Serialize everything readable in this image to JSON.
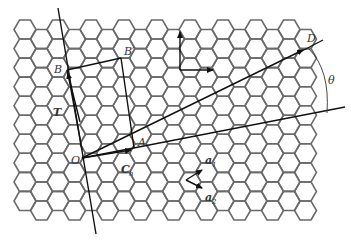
{
  "diagram": {
    "lattice": {
      "type": "honeycomb",
      "hex_orientation": "flat-top",
      "hex_side_px": 11,
      "origin_x": 25,
      "origin_y": 29.5,
      "cols": 18,
      "rows": 11,
      "stroke_color": "#6a6a6a"
    },
    "labels": {
      "O": "O",
      "A": "A",
      "B": "B",
      "B_prime": "B′",
      "D": "D",
      "T": "T",
      "C_h_main": "C",
      "C_h_sub": "h",
      "theta": "θ",
      "x_axis": "x",
      "y_axis": "y",
      "a1_main": "a",
      "a1_sub": "1",
      "a2_main": "a",
      "a2_sub": "2"
    },
    "points": {
      "O": [
        82,
        158
      ],
      "A": [
        134,
        149
      ],
      "B": [
        67,
        70
      ],
      "B_prime": [
        121,
        58
      ],
      "D": [
        305,
        49
      ]
    },
    "colors": {
      "line": "#111111",
      "label": "#333333",
      "background": "#ffffff"
    }
  }
}
